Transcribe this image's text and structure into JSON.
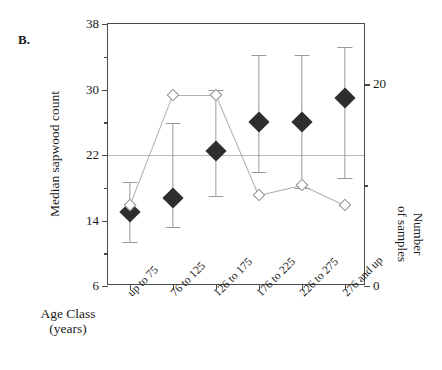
{
  "panel": {
    "label": "B."
  },
  "axes": {
    "left": {
      "title": "Median sapwood count",
      "min": 6,
      "max": 38,
      "major_ticks": [
        6,
        14,
        22,
        30,
        38
      ],
      "minor_ticks": [
        10,
        18,
        26,
        34
      ],
      "tick_labels": [
        "6",
        "14",
        "22",
        "30",
        "38"
      ]
    },
    "right": {
      "title_line1": "Number",
      "title_line2": "of samples",
      "min": 0,
      "max": 26,
      "major_ticks": [
        0,
        20
      ],
      "minor_ticks": [
        10
      ],
      "tick_labels": [
        "0",
        "20"
      ]
    },
    "x": {
      "title_line1": "Age Class",
      "title_line2": "(years)",
      "categories": [
        "up to 75",
        "76 to 125",
        "126 to 175",
        "176 to 225",
        "226 to 275",
        "276 and up"
      ]
    }
  },
  "reference_line": {
    "value": 22,
    "color": "#b9b9b9"
  },
  "colors": {
    "median_marker": "#2e2e2e",
    "error_bar": "#9a9a9a",
    "sample_marker_fill": "#ffffff",
    "sample_marker_edge": "#8e8e8e",
    "sample_line": "#b0b0b0",
    "axis": "#4a4a4a"
  },
  "chart_data": {
    "type": "scatter",
    "title": "B.",
    "xlabel": "Age Class (years)",
    "ylabel": "Median sapwood count",
    "y2label": "Number of samples",
    "ylim": [
      6,
      38
    ],
    "y2lim": [
      0,
      26
    ],
    "grid": false,
    "legend": "none",
    "categories": [
      "up to 75",
      "76 to 125",
      "126 to 175",
      "176 to 225",
      "226 to 275",
      "276 and up"
    ],
    "reference_line_y": 22,
    "series": [
      {
        "name": "Median sapwood count",
        "axis": "left",
        "marker": "filled-diamond",
        "values": [
          15.0,
          16.8,
          22.5,
          26.0,
          26.0,
          29.0
        ],
        "error_low": [
          11.4,
          13.2,
          17.0,
          19.9,
          18.0,
          19.2
        ],
        "error_high": [
          18.7,
          25.9,
          30.0,
          34.2,
          34.2,
          35.2
        ]
      },
      {
        "name": "Number of samples",
        "axis": "right",
        "marker": "open-diamond",
        "values": [
          8,
          19,
          19,
          9,
          10,
          8
        ]
      }
    ]
  }
}
